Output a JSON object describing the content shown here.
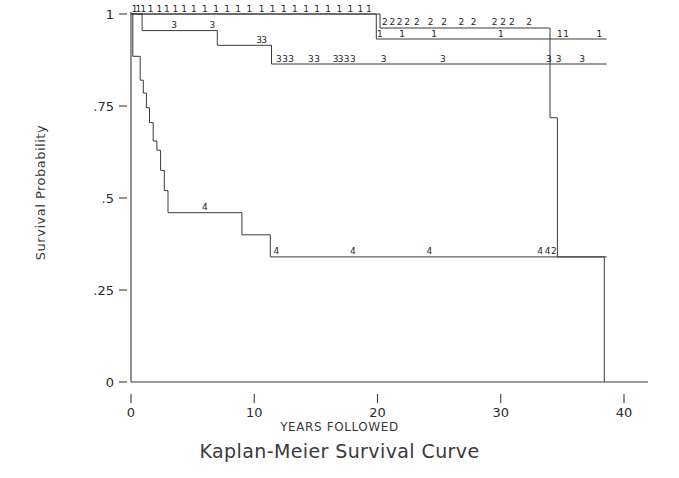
{
  "chart_data": {
    "type": "line",
    "subtype": "kaplan-meier-step",
    "title": "Kaplan-Meier Survival Curve",
    "xlabel": "YEARS FOLLOWED",
    "ylabel": "Survival Probability",
    "xlim": [
      0,
      40
    ],
    "ylim": [
      0,
      1
    ],
    "xticks": [
      0,
      10,
      20,
      30,
      40
    ],
    "xtick_labels": [
      "0",
      "10",
      "20",
      "30",
      "40"
    ],
    "yticks": [
      0,
      0.25,
      0.5,
      0.75,
      1
    ],
    "ytick_labels": [
      "0",
      ".25",
      ".5",
      ".75",
      "1"
    ],
    "grid": false,
    "legend_position": "none",
    "censor_label_note": "Group number printed along each curve as the plotting symbol (1, 2, 3, 4)",
    "series": [
      {
        "name": "1",
        "group_symbol": "1",
        "points": [
          [
            0,
            1.0
          ],
          [
            19.9,
            1.0
          ],
          [
            19.9,
            0.932
          ],
          [
            38.6,
            0.932
          ]
        ],
        "end_value": 0.932
      },
      {
        "name": "2",
        "group_symbol": "2",
        "points": [
          [
            0,
            1.0
          ],
          [
            20.2,
            1.0
          ],
          [
            20.2,
            0.962
          ],
          [
            34.0,
            0.962
          ],
          [
            34.0,
            0.718
          ],
          [
            34.6,
            0.718
          ],
          [
            34.6,
            0.34
          ],
          [
            38.6,
            0.34
          ]
        ],
        "end_value": 0.34
      },
      {
        "name": "3",
        "group_symbol": "3",
        "points": [
          [
            0,
            1.0
          ],
          [
            0.9,
            1.0
          ],
          [
            0.9,
            0.955
          ],
          [
            7.0,
            0.955
          ],
          [
            7.0,
            0.915
          ],
          [
            11.4,
            0.915
          ],
          [
            11.4,
            0.864
          ],
          [
            38.6,
            0.864
          ]
        ],
        "end_value": 0.864
      },
      {
        "name": "4",
        "group_symbol": "4",
        "points": [
          [
            0,
            1.0
          ],
          [
            0.15,
            1.0
          ],
          [
            0.15,
            0.885
          ],
          [
            0.75,
            0.885
          ],
          [
            0.75,
            0.82
          ],
          [
            1.0,
            0.82
          ],
          [
            1.0,
            0.785
          ],
          [
            1.25,
            0.785
          ],
          [
            1.25,
            0.745
          ],
          [
            1.5,
            0.745
          ],
          [
            1.5,
            0.705
          ],
          [
            1.8,
            0.705
          ],
          [
            1.8,
            0.655
          ],
          [
            2.1,
            0.655
          ],
          [
            2.1,
            0.63
          ],
          [
            2.4,
            0.63
          ],
          [
            2.4,
            0.575
          ],
          [
            2.7,
            0.575
          ],
          [
            2.7,
            0.52
          ],
          [
            3.0,
            0.52
          ],
          [
            3.0,
            0.46
          ],
          [
            9.0,
            0.46
          ],
          [
            9.0,
            0.4
          ],
          [
            11.3,
            0.4
          ],
          [
            11.3,
            0.34
          ],
          [
            38.4,
            0.34
          ],
          [
            38.4,
            0.0
          ]
        ],
        "end_value": 0.0
      }
    ],
    "censor_marks": {
      "series_1": [
        {
          "x": 0.3,
          "y": 1.0
        },
        {
          "x": 0.6,
          "y": 1.0
        },
        {
          "x": 1.0,
          "y": 1.0
        },
        {
          "x": 1.6,
          "y": 1.0
        },
        {
          "x": 2.3,
          "y": 1.0
        },
        {
          "x": 2.9,
          "y": 1.0
        },
        {
          "x": 3.6,
          "y": 1.0
        },
        {
          "x": 4.3,
          "y": 1.0
        },
        {
          "x": 5.1,
          "y": 1.0
        },
        {
          "x": 6.0,
          "y": 1.0
        },
        {
          "x": 6.9,
          "y": 1.0
        },
        {
          "x": 7.8,
          "y": 1.0
        },
        {
          "x": 8.7,
          "y": 1.0
        },
        {
          "x": 9.6,
          "y": 1.0
        },
        {
          "x": 10.6,
          "y": 1.0
        },
        {
          "x": 11.5,
          "y": 1.0
        },
        {
          "x": 12.4,
          "y": 1.0
        },
        {
          "x": 13.3,
          "y": 1.0
        },
        {
          "x": 14.2,
          "y": 1.0
        },
        {
          "x": 15.1,
          "y": 1.0
        },
        {
          "x": 16.0,
          "y": 1.0
        },
        {
          "x": 16.9,
          "y": 1.0
        },
        {
          "x": 17.8,
          "y": 1.0
        },
        {
          "x": 18.6,
          "y": 1.0
        },
        {
          "x": 19.3,
          "y": 1.0
        },
        {
          "x": 20.2,
          "y": 0.932
        },
        {
          "x": 22.0,
          "y": 0.932
        },
        {
          "x": 24.6,
          "y": 0.932
        },
        {
          "x": 30.0,
          "y": 0.932
        },
        {
          "x": 34.8,
          "y": 0.932
        },
        {
          "x": 35.3,
          "y": 0.932
        },
        {
          "x": 38.0,
          "y": 0.932
        }
      ],
      "series_2": [
        {
          "x": 20.6,
          "y": 0.962
        },
        {
          "x": 21.2,
          "y": 0.962
        },
        {
          "x": 21.8,
          "y": 0.962
        },
        {
          "x": 22.4,
          "y": 0.962
        },
        {
          "x": 23.2,
          "y": 0.962
        },
        {
          "x": 24.3,
          "y": 0.962
        },
        {
          "x": 25.4,
          "y": 0.962
        },
        {
          "x": 26.8,
          "y": 0.962
        },
        {
          "x": 27.8,
          "y": 0.962
        },
        {
          "x": 29.5,
          "y": 0.962
        },
        {
          "x": 30.2,
          "y": 0.962
        },
        {
          "x": 30.9,
          "y": 0.962
        },
        {
          "x": 32.3,
          "y": 0.962
        },
        {
          "x": 34.3,
          "y": 0.34
        }
      ],
      "series_3": [
        {
          "x": 3.5,
          "y": 0.955
        },
        {
          "x": 6.6,
          "y": 0.955
        },
        {
          "x": 10.4,
          "y": 0.915
        },
        {
          "x": 10.8,
          "y": 0.915
        },
        {
          "x": 12.0,
          "y": 0.864
        },
        {
          "x": 12.5,
          "y": 0.864
        },
        {
          "x": 13.0,
          "y": 0.864
        },
        {
          "x": 14.6,
          "y": 0.864
        },
        {
          "x": 15.1,
          "y": 0.864
        },
        {
          "x": 16.6,
          "y": 0.864
        },
        {
          "x": 17.0,
          "y": 0.864
        },
        {
          "x": 17.5,
          "y": 0.864
        },
        {
          "x": 18.0,
          "y": 0.864
        },
        {
          "x": 20.5,
          "y": 0.864
        },
        {
          "x": 25.3,
          "y": 0.864
        },
        {
          "x": 33.9,
          "y": 0.864
        },
        {
          "x": 34.7,
          "y": 0.864
        },
        {
          "x": 36.6,
          "y": 0.864
        }
      ],
      "series_4": [
        {
          "x": 6.0,
          "y": 0.46
        },
        {
          "x": 11.8,
          "y": 0.34
        },
        {
          "x": 18.0,
          "y": 0.34
        },
        {
          "x": 24.2,
          "y": 0.34
        },
        {
          "x": 33.2,
          "y": 0.34
        },
        {
          "x": 33.8,
          "y": 0.34
        }
      ]
    }
  },
  "figure": {
    "title": "Kaplan-Meier Survival Curve",
    "xaxis_title": "YEARS FOLLOWED",
    "yaxis_title": "Survival Probability"
  }
}
